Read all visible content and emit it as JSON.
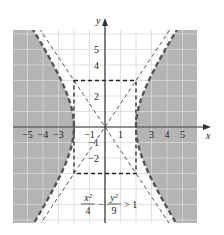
{
  "chart_data": {
    "type": "area",
    "title": "",
    "inequality": {
      "lhs_num1": "x²",
      "lhs_den1": "4",
      "minus": "−",
      "lhs_num2": "y²",
      "lhs_den2": "9",
      "rhs": "> 1"
    },
    "xlabel": "x",
    "ylabel": "y",
    "xlim": [
      -6,
      6
    ],
    "ylim": [
      -6.25,
      6.25
    ],
    "grid": true,
    "x_tick_labels": [
      {
        "v": -5,
        "t": "−5"
      },
      {
        "v": -4,
        "t": "−4"
      },
      {
        "v": -3,
        "t": "−3"
      },
      {
        "v": -1,
        "t": "−1"
      },
      {
        "v": 1,
        "t": "1"
      },
      {
        "v": 3,
        "t": "3"
      },
      {
        "v": 4,
        "t": "4"
      },
      {
        "v": 5,
        "t": "5"
      }
    ],
    "y_tick_labels": [
      {
        "v": 5,
        "t": "5"
      },
      {
        "v": 4,
        "t": "4"
      },
      {
        "v": 2,
        "t": "2"
      },
      {
        "v": -1,
        "t": "−1"
      },
      {
        "v": -2,
        "t": "−2"
      }
    ],
    "hyperbola": {
      "a": 2,
      "b": 3,
      "style": "dashed",
      "shaded": "outside"
    },
    "asymptotes": [
      {
        "slope": 1.5
      },
      {
        "slope": -1.5
      }
    ],
    "fundamental_rectangle": {
      "x": [
        -2,
        2
      ],
      "y": [
        -3,
        3
      ]
    },
    "colors": {
      "shade": "#b4b4b4",
      "grid": "#d8d8d8",
      "curve": "#555555",
      "axis": "#333333"
    }
  }
}
